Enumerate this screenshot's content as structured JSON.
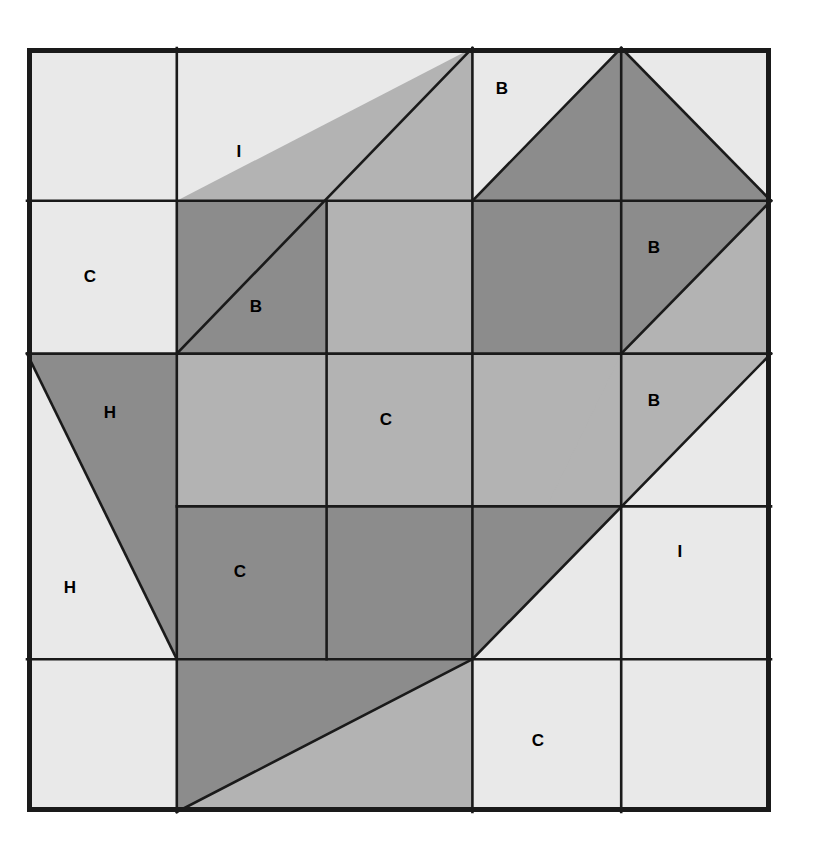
{
  "figure": {
    "kind": "quilt-block-diagram",
    "title": "",
    "canvas": {
      "width": 818,
      "height": 844
    },
    "background": "#ffffff"
  },
  "palette": {
    "light": "#e9e9e9",
    "medium": "#b3b3b3",
    "dark": "#8c8c8c",
    "line": "#1a1a1a",
    "label_text": "#000000",
    "background": "#ffffff"
  },
  "grid": {
    "columns": 5,
    "rows": 5,
    "x_lines": [
      27,
      176.8,
      326.6,
      472.4,
      621.2,
      771
    ],
    "y_lines": [
      48,
      200.8,
      353.6,
      506.4,
      659.2,
      812
    ],
    "outer_border_width": 5,
    "inner_line_width": 2.6
  },
  "chart_data": {
    "type": "diagram",
    "legend_codes": [
      "B",
      "C",
      "H",
      "I"
    ],
    "patch_counts": {
      "B": 4,
      "C": 4,
      "H": 2,
      "I": 2
    }
  },
  "labels": [
    {
      "id": "label-i-top",
      "text": "I",
      "x": 239,
      "y": 152
    },
    {
      "id": "label-b-top",
      "text": "B",
      "x": 502,
      "y": 89
    },
    {
      "id": "label-c-left",
      "text": "C",
      "x": 90,
      "y": 277
    },
    {
      "id": "label-b-upper",
      "text": "B",
      "x": 256,
      "y": 307
    },
    {
      "id": "label-b-right",
      "text": "B",
      "x": 654,
      "y": 248
    },
    {
      "id": "label-h-upper",
      "text": "H",
      "x": 110,
      "y": 413
    },
    {
      "id": "label-c-center",
      "text": "C",
      "x": 386,
      "y": 420
    },
    {
      "id": "label-b-lower",
      "text": "B",
      "x": 654,
      "y": 401
    },
    {
      "id": "label-h-lower",
      "text": "H",
      "x": 70,
      "y": 588
    },
    {
      "id": "label-c-mid",
      "text": "C",
      "x": 240,
      "y": 572
    },
    {
      "id": "label-i-bottom",
      "text": "I",
      "x": 680,
      "y": 552
    },
    {
      "id": "label-c-bottom",
      "text": "C",
      "x": 538,
      "y": 741
    }
  ],
  "patches": [
    {
      "id": "patch-r1c1-light",
      "shape": "rect",
      "tone": "light",
      "points": "27,48 176.8,48 176.8,200.8 27,200.8"
    },
    {
      "id": "patch-r2c1-light",
      "shape": "rect",
      "tone": "light",
      "points": "27,200.8 176.8,200.8 176.8,353.6 27,353.6"
    },
    {
      "id": "patch-i-top-light",
      "shape": "poly",
      "tone": "light",
      "points": "176.8,48 472.4,48 176.8,353.6"
    },
    {
      "id": "patch-b-upper-med",
      "shape": "poly",
      "tone": "medium",
      "points": "472.4,48 472.4,200.8 176.8,200.8"
    },
    {
      "id": "patch-b-upper-dark",
      "shape": "poly",
      "tone": "dark",
      "points": "176.8,200.8 326.6,200.8 326.6,353.6 176.8,353.6"
    },
    {
      "id": "patch-r2c3-med",
      "shape": "rect",
      "tone": "medium",
      "points": "326.6,200.8 472.4,200.8 472.4,353.6 326.6,353.6"
    },
    {
      "id": "patch-bt-left-light",
      "shape": "poly",
      "tone": "light",
      "points": "472.4,48 621.2,48 472.4,200.8"
    },
    {
      "id": "patch-bt-right-light",
      "shape": "poly",
      "tone": "light",
      "points": "621.2,48 771,48 771,200.8"
    },
    {
      "id": "patch-bt-dark",
      "shape": "poly",
      "tone": "dark",
      "points": "621.2,48 771,200.8 472.4,200.8"
    },
    {
      "id": "patch-r2c4-dark",
      "shape": "rect",
      "tone": "dark",
      "points": "472.4,200.8 621.2,200.8 621.2,353.6 472.4,353.6"
    },
    {
      "id": "patch-b-right-dark",
      "shape": "poly",
      "tone": "dark",
      "points": "621.2,200.8 771,200.8 621.2,353.6"
    },
    {
      "id": "patch-b-right-med",
      "shape": "poly",
      "tone": "medium",
      "points": "771,200.8 771,353.6 621.2,353.6"
    },
    {
      "id": "patch-h-light",
      "shape": "poly",
      "tone": "light",
      "points": "27,353.6 176.8,659.2 27,659.2"
    },
    {
      "id": "patch-h-dark",
      "shape": "poly",
      "tone": "dark",
      "points": "27,353.6 176.8,353.6 176.8,659.2"
    },
    {
      "id": "patch-r3c2-med",
      "shape": "rect",
      "tone": "medium",
      "points": "176.8,353.6 326.6,353.6 326.6,506.4 176.8,506.4"
    },
    {
      "id": "patch-r3c3-med",
      "shape": "rect",
      "tone": "medium",
      "points": "326.6,353.6 472.4,353.6 472.4,506.4 326.6,506.4"
    },
    {
      "id": "patch-r3c4-med",
      "shape": "rect",
      "tone": "medium",
      "points": "472.4,353.6 621.2,353.6 621.2,506.4 472.4,506.4"
    },
    {
      "id": "patch-r4c2-dark",
      "shape": "rect",
      "tone": "dark",
      "points": "176.8,506.4 326.6,506.4 326.6,659.2 176.8,659.2"
    },
    {
      "id": "patch-r4c3-dark",
      "shape": "rect",
      "tone": "dark",
      "points": "326.6,506.4 472.4,506.4 472.4,659.2 326.6,659.2"
    },
    {
      "id": "patch-i-big-med",
      "shape": "poly",
      "tone": "medium",
      "points": "621.2,353.6 771,353.6 771,659.2 472.4,659.2"
    },
    {
      "id": "patch-i-big-light",
      "shape": "poly",
      "tone": "light",
      "points": "771,353.6 771,659.2 472.4,659.2"
    },
    {
      "id": "patch-r4c4-dark",
      "shape": "poly",
      "tone": "dark",
      "points": "472.4,506.4 621.2,506.4 472.4,659.2"
    },
    {
      "id": "patch-r5c1-light",
      "shape": "rect",
      "tone": "light",
      "points": "27,659.2 176.8,659.2 176.8,812 27,812"
    },
    {
      "id": "patch-bottom-tri-med",
      "shape": "poly",
      "tone": "medium",
      "points": "176.8,659.2 472.4,659.2 176.8,812"
    },
    {
      "id": "patch-bottom-tri-dark",
      "shape": "poly",
      "tone": "dark",
      "points": "176.8,659.2 472.4,659.2 176.8,812"
    },
    {
      "id": "patch-r5c3-med",
      "shape": "poly",
      "tone": "medium",
      "points": "176.8,812 472.4,659.2 472.4,812"
    },
    {
      "id": "patch-r5c4-light",
      "shape": "rect",
      "tone": "light",
      "points": "472.4,659.2 621.2,659.2 621.2,812 472.4,812"
    },
    {
      "id": "patch-r5c5-light",
      "shape": "rect",
      "tone": "light",
      "points": "621.2,659.2 771,659.2 771,812 621.2,812"
    }
  ],
  "inner_lines": [
    {
      "id": "grid-v-1",
      "x1": 176.8,
      "y1": 48,
      "x2": 176.8,
      "y2": 812
    },
    {
      "id": "grid-v-2",
      "x1": 326.6,
      "y1": 353.6,
      "x2": 326.6,
      "y2": 659.2
    },
    {
      "id": "grid-v-2b",
      "x1": 326.6,
      "y1": 200.8,
      "x2": 326.6,
      "y2": 353.6
    },
    {
      "id": "grid-v-3",
      "x1": 472.4,
      "y1": 48,
      "x2": 472.4,
      "y2": 812
    },
    {
      "id": "grid-v-4",
      "x1": 621.2,
      "y1": 48,
      "x2": 621.2,
      "y2": 812
    },
    {
      "id": "grid-h-1",
      "x1": 27,
      "y1": 200.8,
      "x2": 771,
      "y2": 200.8
    },
    {
      "id": "grid-h-2",
      "x1": 27,
      "y1": 353.6,
      "x2": 771,
      "y2": 353.6
    },
    {
      "id": "grid-h-3",
      "x1": 176.8,
      "y1": 506.4,
      "x2": 771,
      "y2": 506.4
    },
    {
      "id": "grid-h-4",
      "x1": 27,
      "y1": 659.2,
      "x2": 771,
      "y2": 659.2
    }
  ],
  "diagonals": [
    {
      "id": "diag-i-top",
      "x1": 176.8,
      "y1": 353.6,
      "x2": 472.4,
      "y2": 48
    },
    {
      "id": "diag-bt-left",
      "x1": 472.4,
      "y1": 200.8,
      "x2": 621.2,
      "y2": 48
    },
    {
      "id": "diag-bt-right",
      "x1": 621.2,
      "y1": 48,
      "x2": 771,
      "y2": 200.8
    },
    {
      "id": "diag-b-right",
      "x1": 621.2,
      "y1": 353.6,
      "x2": 771,
      "y2": 200.8
    },
    {
      "id": "diag-h",
      "x1": 27,
      "y1": 353.6,
      "x2": 176.8,
      "y2": 659.2
    },
    {
      "id": "diag-i-big",
      "x1": 472.4,
      "y1": 659.2,
      "x2": 771,
      "y2": 353.6
    },
    {
      "id": "diag-bottom-tri",
      "x1": 176.8,
      "y1": 812,
      "x2": 472.4,
      "y2": 659.2
    }
  ]
}
